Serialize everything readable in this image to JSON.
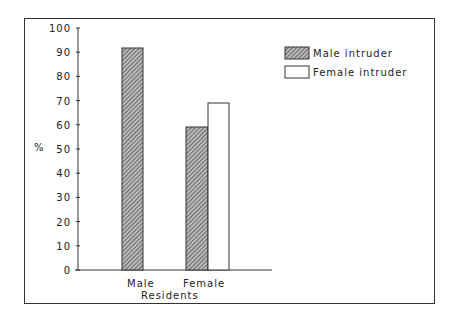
{
  "chart_data": {
    "type": "bar",
    "title": "",
    "xlabel": "Residents",
    "ylabel": "%",
    "ylim": [
      0,
      100
    ],
    "yticks": [
      0,
      10,
      20,
      30,
      40,
      50,
      60,
      70,
      80,
      90,
      100
    ],
    "categories": [
      "Male",
      "Female"
    ],
    "series": [
      {
        "name": "Male intruder",
        "values": [
          91,
          59
        ],
        "pattern": "hatched"
      },
      {
        "name": "Female intruder",
        "values": [
          null,
          69
        ],
        "pattern": "white"
      }
    ],
    "legend_position": "top-right",
    "grid": false
  },
  "legend": {
    "items": [
      "Male intruder",
      "Female intruder"
    ]
  },
  "axis": {
    "xlabel": "Residents",
    "ylabel": "%",
    "cat0": "Male",
    "cat1": "Female"
  },
  "ticks": [
    "0",
    "10",
    "20",
    "30",
    "40",
    "50",
    "60",
    "70",
    "80",
    "90",
    "100"
  ]
}
